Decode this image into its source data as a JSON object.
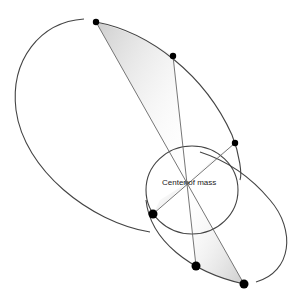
{
  "diagram": {
    "center_label": "Center of mass",
    "center": {
      "x": 187,
      "y": 183
    },
    "colors": {
      "orbit": "#444444",
      "chord": "#666666",
      "dot": "#000000",
      "sweep": "#bbbbbb"
    },
    "bodies": [
      {
        "name": "body-a-pos-1",
        "x": 96,
        "y": 22,
        "r": 3.2
      },
      {
        "name": "body-a-pos-2",
        "x": 173,
        "y": 56,
        "r": 3.2
      },
      {
        "name": "body-a-pos-3",
        "x": 235,
        "y": 143,
        "r": 3.2
      },
      {
        "name": "body-b-pos-1",
        "x": 153,
        "y": 214,
        "r": 4.5
      },
      {
        "name": "body-b-pos-2",
        "x": 196,
        "y": 266,
        "r": 4.5
      },
      {
        "name": "body-b-pos-3",
        "x": 244,
        "y": 284,
        "r": 4.5
      }
    ]
  }
}
